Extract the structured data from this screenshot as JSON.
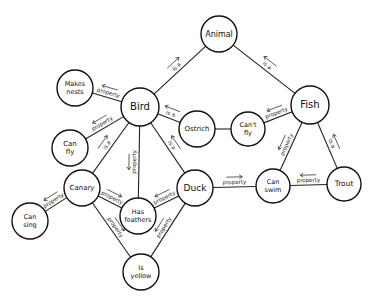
{
  "diagram": {
    "type": "semantic-network",
    "nodes": [
      {
        "id": "animal",
        "lines": [
          "Animal"
        ],
        "x": 219,
        "y": 34,
        "r": 18,
        "fs": 8
      },
      {
        "id": "bird",
        "lines": [
          "Bird"
        ],
        "x": 140,
        "y": 107,
        "r": 19,
        "fs": 10
      },
      {
        "id": "fish",
        "lines": [
          "Fish"
        ],
        "x": 310,
        "y": 105,
        "r": 19,
        "fs": 10
      },
      {
        "id": "makes-nests",
        "lines": [
          "Makes",
          "nests"
        ],
        "x": 75,
        "y": 88,
        "r": 18,
        "fs": 6.5
      },
      {
        "id": "can-fly",
        "lines": [
          "Can",
          "fly"
        ],
        "x": 70,
        "y": 148,
        "r": 18,
        "fs": 7
      },
      {
        "id": "ostrich",
        "lines": [
          "Ostrich"
        ],
        "x": 197,
        "y": 129,
        "r": 18,
        "fs": 7
      },
      {
        "id": "cant-fly",
        "lines": [
          "Can't",
          "fly"
        ],
        "x": 248,
        "y": 129,
        "r": 17,
        "fs": 6.5
      },
      {
        "id": "canary",
        "lines": [
          "Canary"
        ],
        "x": 82,
        "y": 188,
        "r": 18,
        "fs": 7
      },
      {
        "id": "duck",
        "lines": [
          "Duck"
        ],
        "x": 195,
        "y": 188,
        "r": 18,
        "fs": 9
      },
      {
        "id": "can-swim",
        "lines": [
          "Can",
          "swim"
        ],
        "x": 273,
        "y": 186,
        "r": 17,
        "fs": 6.5
      },
      {
        "id": "trout",
        "lines": [
          "Trout"
        ],
        "x": 344,
        "y": 184,
        "r": 17,
        "fs": 7.5
      },
      {
        "id": "has-feathers",
        "lines": [
          "Has",
          "feathers"
        ],
        "x": 138,
        "y": 216,
        "r": 18,
        "fs": 6.5
      },
      {
        "id": "can-sing",
        "lines": [
          "Can",
          "sing"
        ],
        "x": 30,
        "y": 221,
        "r": 18,
        "fs": 6.5
      },
      {
        "id": "is-yellow",
        "lines": [
          "Is",
          "yellow"
        ],
        "x": 141,
        "y": 272,
        "r": 18,
        "fs": 6.5
      }
    ],
    "edges": [
      {
        "from": "bird",
        "to": "animal",
        "label": "is a"
      },
      {
        "from": "fish",
        "to": "animal",
        "label": "is a"
      },
      {
        "from": "bird",
        "to": "makes-nests",
        "label": "property"
      },
      {
        "from": "bird",
        "to": "can-fly",
        "label": "property"
      },
      {
        "from": "ostrich",
        "to": "bird",
        "label": "is a"
      },
      {
        "from": "ostrich",
        "to": "cant-fly",
        "label": ""
      },
      {
        "from": "fish",
        "to": "cant-fly",
        "label": "property"
      },
      {
        "from": "canary",
        "to": "bird",
        "label": "is a"
      },
      {
        "from": "duck",
        "to": "bird",
        "label": "is a"
      },
      {
        "from": "bird",
        "to": "has-feathers",
        "label": "property"
      },
      {
        "from": "fish",
        "to": "can-swim",
        "label": "property"
      },
      {
        "from": "trout",
        "to": "fish",
        "label": "is a"
      },
      {
        "from": "canary",
        "to": "can-sing",
        "label": "property"
      },
      {
        "from": "canary",
        "to": "has-feathers",
        "label": "property"
      },
      {
        "from": "canary",
        "to": "is-yellow",
        "label": "property"
      },
      {
        "from": "duck",
        "to": "has-feathers",
        "label": "property"
      },
      {
        "from": "duck",
        "to": "is-yellow",
        "label": "property"
      },
      {
        "from": "duck",
        "to": "can-swim",
        "label": "property"
      },
      {
        "from": "trout",
        "to": "can-swim",
        "label": "property"
      }
    ]
  }
}
